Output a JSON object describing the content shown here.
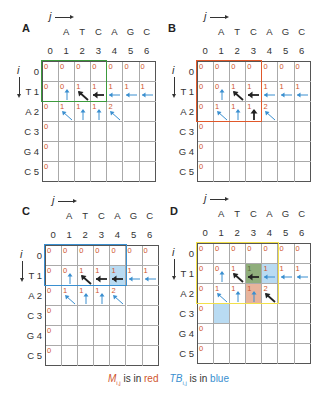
{
  "seq_j": [
    "A",
    "T",
    "C",
    "A",
    "G",
    "C"
  ],
  "col_nums": [
    "0",
    "1",
    "2",
    "3",
    "4",
    "5",
    "6"
  ],
  "row_labels": [
    "0",
    "T 1",
    "A 2",
    "C 3",
    "G 4",
    "C 5"
  ],
  "axis": {
    "j": "j",
    "i": "i"
  },
  "colors": {
    "m_red": "#d0552e",
    "tb_blue": "#3a8fd0",
    "green_box": "#3c9a3c",
    "orange_box": "#e0582a",
    "blue_box": "#3a8fd0",
    "yellow_box": "#f2e04a"
  },
  "panels": [
    {
      "label": "A",
      "highlight": {
        "color": "#3c9a3c",
        "rows": [
          0,
          1
        ],
        "cols": [
          0,
          3
        ]
      }
    },
    {
      "label": "B",
      "highlight": {
        "color": "#e0582a",
        "rows": [
          0,
          2
        ],
        "cols": [
          0,
          3
        ]
      }
    },
    {
      "label": "C",
      "highlight": {
        "color": "#3a8fd0",
        "rows": [
          0,
          1
        ],
        "cols": [
          0,
          4
        ]
      },
      "fill": [
        {
          "r": 1,
          "c": 4,
          "color": "#b9dbf2"
        }
      ]
    },
    {
      "label": "D",
      "highlight": {
        "color": "#f2e04a",
        "rows": [
          0,
          2
        ],
        "cols": [
          0,
          4
        ]
      },
      "fill": [
        {
          "r": 1,
          "c": 3,
          "color": "#8fae7c"
        },
        {
          "r": 1,
          "c": 4,
          "color": "#b9dbf2"
        },
        {
          "r": 2,
          "c": 3,
          "color": "#e8b49c"
        },
        {
          "r": 3,
          "c": 1,
          "color": "#b9dbf2"
        }
      ]
    }
  ],
  "matrix_M": [
    [
      "0",
      "0",
      "0",
      "0",
      "0",
      "0",
      "0"
    ],
    [
      "0",
      "0",
      "1",
      "1",
      "1",
      "1",
      "1"
    ],
    [
      "0",
      "1",
      "1",
      "1",
      "2",
      "",
      ""
    ],
    [
      "0",
      "",
      "",
      "",
      "",
      "",
      ""
    ],
    [
      "0",
      "",
      "",
      "",
      "",
      "",
      ""
    ],
    [
      "0",
      "",
      "",
      "",
      "",
      "",
      ""
    ]
  ],
  "legend": {
    "m_label": "M",
    "m_sub": "i,j",
    "m_text": " is in ",
    "m_color": "red",
    "tb_label": "TB",
    "tb_sub": "i,j",
    "tb_text": " is in ",
    "tb_color": "blue"
  }
}
